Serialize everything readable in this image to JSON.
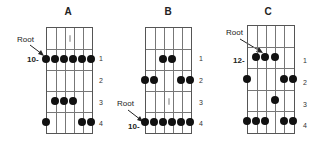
{
  "diagrams": [
    {
      "title": "A",
      "root_label": "Root",
      "start_fret_label": "10-",
      "row_labels": [
        "1",
        "2",
        "3",
        "4"
      ],
      "dots": [
        [
          1,
          0
        ],
        [
          1,
          1
        ],
        [
          1,
          2
        ],
        [
          1,
          3
        ],
        [
          1,
          4
        ],
        [
          1,
          5
        ],
        [
          3,
          1
        ],
        [
          3,
          2
        ],
        [
          3,
          3
        ],
        [
          4,
          0
        ],
        [
          4,
          4
        ],
        [
          4,
          5
        ]
      ],
      "inlay": [
        0,
        2.5
      ]
    },
    {
      "title": "B",
      "root_label": "Root",
      "start_fret_label": "10-",
      "row_labels": [
        "1",
        "2",
        "3",
        "4"
      ],
      "dots": [
        [
          1,
          2
        ],
        [
          1,
          3
        ],
        [
          2,
          0
        ],
        [
          2,
          1
        ],
        [
          2,
          4
        ],
        [
          2,
          5
        ],
        [
          4,
          0
        ],
        [
          4,
          1
        ],
        [
          4,
          2
        ],
        [
          4,
          3
        ],
        [
          4,
          4
        ],
        [
          4,
          5
        ]
      ],
      "inlay": [
        3,
        2.5
      ]
    },
    {
      "title": "C",
      "root_label": "Root",
      "start_fret_label": "12-",
      "row_labels": [
        "1",
        "2",
        "3",
        "4"
      ],
      "dots": [
        [
          1,
          1
        ],
        [
          1,
          2
        ],
        [
          1,
          3
        ],
        [
          2,
          0
        ],
        [
          2,
          4
        ],
        [
          2,
          5
        ],
        [
          3,
          3
        ],
        [
          4,
          0
        ],
        [
          4,
          1
        ],
        [
          4,
          2
        ],
        [
          4,
          4
        ],
        [
          4,
          5
        ]
      ],
      "inlay": null
    }
  ]
}
